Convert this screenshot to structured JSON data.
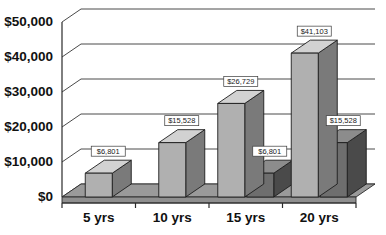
{
  "chart_data": {
    "type": "bar",
    "title": "",
    "subtitle": "",
    "xlabel": "",
    "ylabel": "",
    "categories": [
      "5 yrs",
      "10 yrs",
      "15 yrs",
      "20 yrs"
    ],
    "series": [
      {
        "name": "Series 1",
        "color": "#b0b0b0",
        "side_color": "#7a7a7a",
        "top_color": "#d2d2d2",
        "values": [
          6801,
          15528,
          26729,
          41103
        ],
        "labels": [
          "$6,801",
          "$15,528",
          "$26,729",
          "$41,103"
        ]
      },
      {
        "name": "Series 2",
        "color": "#6e6e6e",
        "side_color": "#4a4a4a",
        "top_color": "#8c8c8c",
        "values": [
          null,
          null,
          6801,
          15528
        ],
        "labels": [
          null,
          null,
          "$6,801",
          "$15,528"
        ]
      }
    ],
    "ylim": [
      0,
      50000
    ],
    "ytick_values": [
      0,
      10000,
      20000,
      30000,
      40000,
      50000
    ],
    "ytick_labels": [
      "$0",
      "$10,000",
      "$20,000",
      "$30,000",
      "$40,000",
      "$50,000"
    ],
    "grid": true,
    "legend": false,
    "legend_position": "none",
    "style": "3d-clustered-column",
    "background_color": "#ffffff",
    "axis_color": "#2a2a2a",
    "gridline_color": "#4a4a4a"
  }
}
